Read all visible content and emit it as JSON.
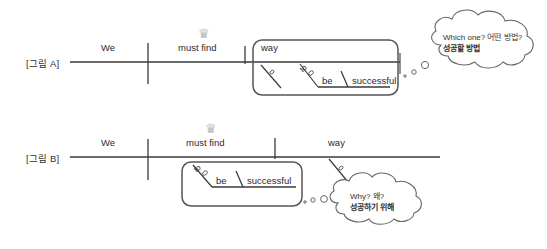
{
  "figures": [
    {
      "label": "[그림 A]",
      "words": {
        "subject": "We",
        "verb": "must find",
        "object": "way",
        "infinitive_marker": "to",
        "infinitive_verb": "be",
        "complement": "successful"
      },
      "bubble": {
        "line1": "Which one? 어떤 방법?",
        "line2": "성공할 방법"
      },
      "crown": "crown"
    },
    {
      "label": "[그림 B]",
      "words": {
        "subject": "We",
        "verb": "must find",
        "object": "way",
        "infinitive_marker": "to",
        "infinitive_verb": "be",
        "complement": "successful"
      },
      "bubble": {
        "line1": "Why? 왜?",
        "line2": "성공하기 위해"
      },
      "crown": "crown"
    }
  ],
  "colors": {
    "ink": "#3a3a3a",
    "crown": "#b9b9b9",
    "background": "#ffffff"
  }
}
